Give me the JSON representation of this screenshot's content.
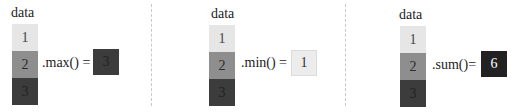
{
  "panels": [
    {
      "title": "data",
      "cells": [
        "1",
        "2",
        "3"
      ],
      "operation": ".max() =",
      "result": "3"
    },
    {
      "title": "data",
      "cells": [
        "1",
        "2",
        "3"
      ],
      "operation": ".min() =",
      "result": "1"
    },
    {
      "title": "data",
      "cells": [
        "1",
        "2",
        "3"
      ],
      "operation": ".sum()=",
      "result": "6"
    }
  ],
  "colors": {
    "cell_1": "#e6e6e6",
    "cell_2": "#8e8e8e",
    "cell_3": "#3c3c3c",
    "result_max": "#3c3c3c",
    "result_min": "#ececec",
    "result_sum": "#222222"
  }
}
